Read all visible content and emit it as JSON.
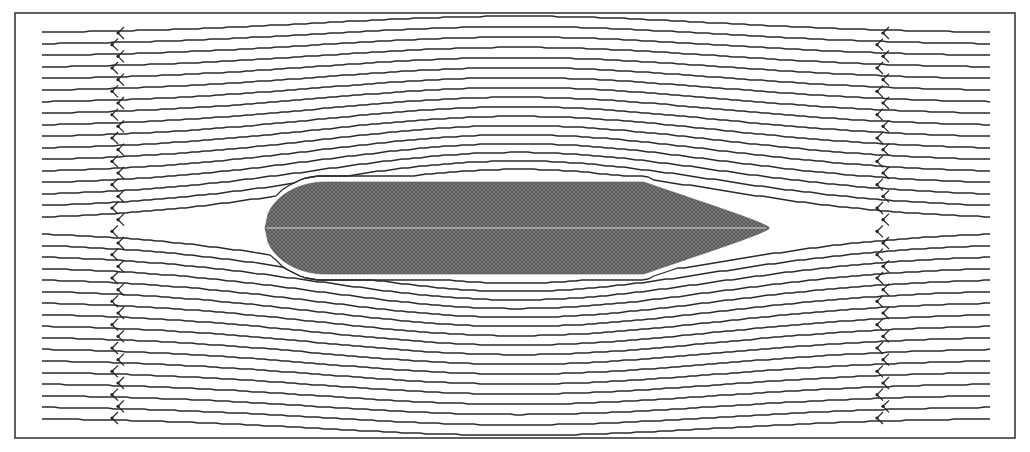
{
  "figure": {
    "type": "streamline-flow-diagram",
    "frame": {
      "x": 15,
      "y": 13,
      "width": 1000,
      "height": 425,
      "stroke": "#3a3a3a"
    },
    "flow_direction": "right-to-left",
    "streamlines": {
      "count": 34,
      "x_start": 42,
      "x_end": 990,
      "y_first": 33,
      "y_last": 418,
      "color": "#2b2b2b"
    },
    "arrow_columns": [
      {
        "name": "upstream-left",
        "x": 115
      },
      {
        "name": "upstream-right",
        "x": 880
      }
    ],
    "body": {
      "shape": "elongated ellipse, rounded nose on left, pointed tail on right",
      "x_left": 265,
      "x_right": 770,
      "y_top": 182,
      "y_bottom": 274,
      "center_y": 228,
      "fill": "#6e6e6e",
      "centerline_color": "#d8d8d8"
    },
    "caption": ""
  }
}
